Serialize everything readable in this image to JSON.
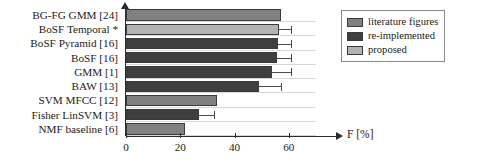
{
  "chart_data": {
    "type": "bar",
    "orientation": "horizontal",
    "title": "",
    "xlabel": "F [%]",
    "ylabel": "",
    "xlim": [
      0,
      70
    ],
    "xticks": [
      0,
      20,
      40,
      60
    ],
    "xtick_labels": [
      "0",
      "20",
      "40",
      "60"
    ],
    "grid": true,
    "grid_axis": "x-rows",
    "legend_position": "top-right",
    "legend": [
      {
        "label": "literature figures",
        "color": "#808080"
      },
      {
        "label": "re-implemented",
        "color": "#3f3f3f"
      },
      {
        "label": "proposed",
        "color": "#b3b3b3"
      }
    ],
    "categories": [
      "BG-FG GMM [24]",
      "BoSF Temporal *",
      "BoSF Pyramid [16]",
      "BoSF [16]",
      "GMM [1]",
      "BAW [13]",
      "SVM MFCC [12]",
      "Fisher LinSVM [3]",
      "NMF baseline [6]"
    ],
    "bars": [
      {
        "category": "BG-FG GMM [24]",
        "value": 57.0,
        "error": 0.0,
        "group": "literature figures",
        "color": "#808080"
      },
      {
        "category": "BoSF Temporal *",
        "value": 56.4,
        "error": 4.3,
        "group": "proposed",
        "color": "#b3b3b3"
      },
      {
        "category": "BoSF Pyramid [16]",
        "value": 56.1,
        "error": 4.6,
        "group": "re-implemented",
        "color": "#3f3f3f"
      },
      {
        "category": "BoSF [16]",
        "value": 55.7,
        "error": 5.0,
        "group": "re-implemented",
        "color": "#3f3f3f"
      },
      {
        "category": "GMM [1]",
        "value": 53.8,
        "error": 6.9,
        "group": "re-implemented",
        "color": "#3f3f3f"
      },
      {
        "category": "BAW [13]",
        "value": 48.9,
        "error": 8.2,
        "group": "re-implemented",
        "color": "#3f3f3f"
      },
      {
        "category": "SVM MFCC [12]",
        "value": 33.4,
        "error": 0.0,
        "group": "literature figures",
        "color": "#808080"
      },
      {
        "category": "Fisher LinSVM [3]",
        "value": 26.9,
        "error": 5.6,
        "group": "re-implemented",
        "color": "#3f3f3f"
      },
      {
        "category": "NMF baseline [6]",
        "value": 21.6,
        "error": 0.0,
        "group": "literature figures",
        "color": "#808080"
      }
    ]
  },
  "axis": {
    "x_title": "F [%]",
    "tick_labels": [
      "0",
      "20",
      "40",
      "60"
    ]
  },
  "legend": {
    "items": [
      {
        "label": "literature figures"
      },
      {
        "label": "re-implemented"
      },
      {
        "label": "proposed"
      }
    ]
  }
}
